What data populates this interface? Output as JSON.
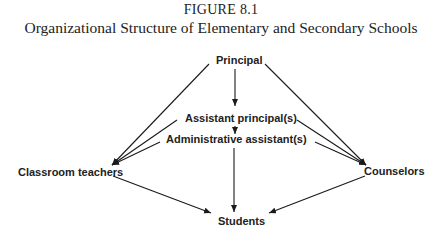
{
  "figure": {
    "number": "FIGURE 8.1",
    "title": "Organizational Structure of Elementary and Secondary Schools"
  },
  "nodes": {
    "principal": "Principal",
    "assistant_principal": "Assistant  principal(s)",
    "administrative_assistant": "Administrative  assistant(s)",
    "classroom_teachers": "Classroom  teachers",
    "counselors": "Counselors",
    "students": "Students"
  },
  "edges": [
    {
      "from": "Principal",
      "to": "Assistant principal(s)"
    },
    {
      "from": "Assistant principal(s)",
      "to": "Administrative assistant(s)"
    },
    {
      "from": "Administrative assistant(s)",
      "to": "Students"
    },
    {
      "from": "Principal",
      "to": "Classroom teachers"
    },
    {
      "from": "Assistant principal(s)",
      "to": "Classroom teachers"
    },
    {
      "from": "Administrative assistant(s)",
      "to": "Classroom teachers"
    },
    {
      "from": "Principal",
      "to": "Counselors"
    },
    {
      "from": "Assistant principal(s)",
      "to": "Counselors"
    },
    {
      "from": "Administrative assistant(s)",
      "to": "Counselors"
    },
    {
      "from": "Classroom teachers",
      "to": "Students"
    },
    {
      "from": "Counselors",
      "to": "Students"
    }
  ],
  "colors": {
    "line": "#1a1a1a",
    "text": "#222222",
    "background": "#ffffff"
  }
}
